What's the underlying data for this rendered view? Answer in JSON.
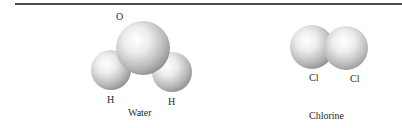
{
  "figure": {
    "molecules": [
      {
        "name": "Water",
        "atoms": [
          {
            "symbol": "O"
          },
          {
            "symbol": "H"
          },
          {
            "symbol": "H"
          }
        ]
      },
      {
        "name": "Chlorine",
        "atoms": [
          {
            "symbol": "Cl"
          },
          {
            "symbol": "Cl"
          }
        ]
      }
    ]
  }
}
